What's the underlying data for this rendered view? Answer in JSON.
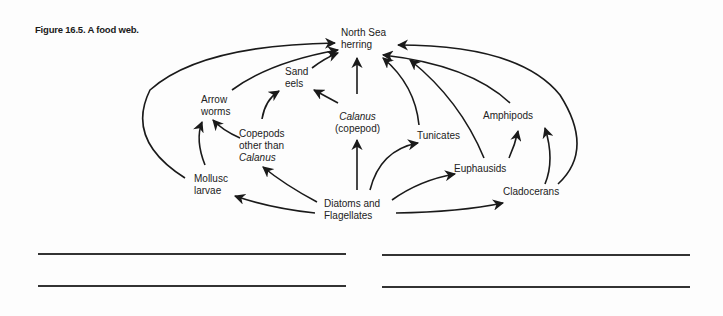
{
  "figure": {
    "caption": "Figure 16.5. A food web."
  },
  "nodes": {
    "herring": {
      "line1": "North Sea",
      "line2": "herring"
    },
    "sand_eels": {
      "line1": "Sand",
      "line2": "eels"
    },
    "arrow_worms": {
      "line1": "Arrow",
      "line2": "worms"
    },
    "calanus": {
      "line1": "Calanus",
      "line2": "(copepod)"
    },
    "copepods_other": {
      "line1": "Copepods",
      "line2": "other than",
      "line3": "Calanus"
    },
    "tunicates": {
      "line1": "Tunicates"
    },
    "amphipods": {
      "line1": "Amphipods"
    },
    "euphausids": {
      "line1": "Euphausids"
    },
    "mollusc_larvae": {
      "line1": "Mollusc",
      "line2": "larvae"
    },
    "diatoms": {
      "line1": "Diatoms and",
      "line2": "Flagellates"
    },
    "cladocerans": {
      "line1": "Cladocerans"
    }
  },
  "edges": [
    {
      "from": "Diatoms and Flagellates",
      "to": "Calanus (copepod)"
    },
    {
      "from": "Diatoms and Flagellates",
      "to": "Tunicates"
    },
    {
      "from": "Diatoms and Flagellates",
      "to": "Euphausids"
    },
    {
      "from": "Diatoms and Flagellates",
      "to": "Cladocerans"
    },
    {
      "from": "Diatoms and Flagellates",
      "to": "Mollusc larvae"
    },
    {
      "from": "Diatoms and Flagellates",
      "to": "Copepods other than Calanus"
    },
    {
      "from": "Mollusc larvae",
      "to": "Arrow worms"
    },
    {
      "from": "Mollusc larvae",
      "to": "North Sea herring"
    },
    {
      "from": "Copepods other than Calanus",
      "to": "Arrow worms"
    },
    {
      "from": "Copepods other than Calanus",
      "to": "Sand eels"
    },
    {
      "from": "Calanus (copepod)",
      "to": "Sand eels"
    },
    {
      "from": "Calanus (copepod)",
      "to": "North Sea herring"
    },
    {
      "from": "Arrow worms",
      "to": "North Sea herring"
    },
    {
      "from": "Sand eels",
      "to": "North Sea herring"
    },
    {
      "from": "Tunicates",
      "to": "North Sea herring"
    },
    {
      "from": "Euphausids",
      "to": "North Sea herring"
    },
    {
      "from": "Euphausids",
      "to": "Amphipods"
    },
    {
      "from": "Amphipods",
      "to": "North Sea herring"
    },
    {
      "from": "Cladocerans",
      "to": "Amphipods"
    },
    {
      "from": "Cladocerans",
      "to": "North Sea herring"
    }
  ],
  "answer_lines": 4
}
